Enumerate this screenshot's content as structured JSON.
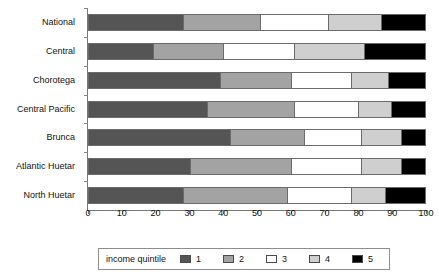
{
  "chart_data": {
    "type": "bar",
    "orientation": "horizontal",
    "stacked": true,
    "normalized_percent": true,
    "title": "",
    "xlabel": "",
    "ylabel": "",
    "xlim": [
      0,
      100
    ],
    "xticks": [
      0,
      10,
      20,
      30,
      40,
      50,
      60,
      70,
      80,
      90,
      100
    ],
    "xtick_labels": [
      "0",
      "10",
      "20",
      "30",
      "40",
      "50",
      "60",
      "70",
      "80",
      "90",
      "100"
    ],
    "grid": false,
    "legend_title": "income quintile",
    "legend_position": "bottom",
    "categories": [
      "National",
      "Central",
      "Chorotega",
      "Central Pacific",
      "Brunca",
      "Atlantic Huetar",
      "North Huetar"
    ],
    "series": [
      {
        "name": "1",
        "color": "#555555",
        "values": [
          28,
          19,
          39,
          35,
          42,
          30,
          28
        ]
      },
      {
        "name": "2",
        "color": "#a3a3a3",
        "values": [
          23,
          21,
          21,
          26,
          22,
          30,
          31
        ]
      },
      {
        "name": "3",
        "color": "#ffffff",
        "values": [
          20,
          21,
          18,
          19,
          17,
          21,
          19
        ]
      },
      {
        "name": "4",
        "color": "#cfcfcf",
        "values": [
          16,
          21,
          11,
          10,
          12,
          12,
          10
        ]
      },
      {
        "name": "5",
        "color": "#000000",
        "values": [
          13,
          18,
          11,
          10,
          7,
          7,
          12
        ]
      }
    ]
  },
  "legend": {
    "title": "income quintile",
    "items": [
      {
        "label": "1",
        "color": "#555555"
      },
      {
        "label": "2",
        "color": "#a3a3a3"
      },
      {
        "label": "3",
        "color": "#ffffff"
      },
      {
        "label": "4",
        "color": "#cfcfcf"
      },
      {
        "label": "5",
        "color": "#000000"
      }
    ]
  }
}
